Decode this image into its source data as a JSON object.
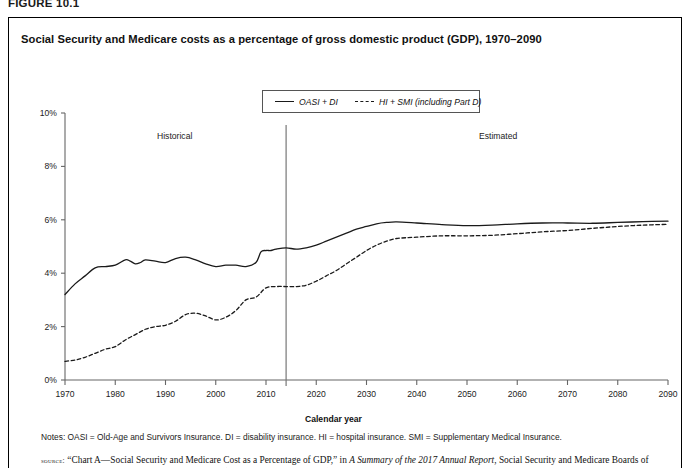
{
  "figure": {
    "number": "FIGURE 10.1",
    "title": "Social Security and Medicare costs as a percentage of gross domestic product (GDP), 1970–2090"
  },
  "notes": {
    "text": "Notes: OASI = Old-Age and Survivors Insurance. DI = disability insurance. HI = hospital insurance. SMI = Supplementary Medical Insurance."
  },
  "source": {
    "label": "source:",
    "part1": "“Chart A—Social Security and Medicare Cost as a Percentage of GDP,” in",
    "italic": "A Summary of the 2017 Annual Report",
    "part2": ", Social Security and Medicare Boards of Trustees, 2017, https://www.ssa.gov/oact/trsum/ (accessed October 30, 2017)"
  },
  "annotations": {
    "historical": "Historical",
    "estimated": "Estimated",
    "divider_year": 2014
  },
  "chart_data": {
    "type": "line",
    "title": "Social Security and Medicare costs as a percentage of gross domestic product (GDP), 1970–2090",
    "xlabel": "Calendar year",
    "ylabel": "",
    "xlim": [
      1970,
      2090
    ],
    "ylim": [
      0,
      10
    ],
    "xticks": [
      1970,
      1980,
      1990,
      2000,
      2010,
      2020,
      2030,
      2040,
      2050,
      2060,
      2070,
      2080,
      2090
    ],
    "xtick_labels": [
      "1970",
      "1980",
      "1990",
      "2000",
      "2010",
      "2020",
      "2030",
      "2040",
      "2050",
      "2060",
      "2070",
      "2080",
      "2090"
    ],
    "yticks": [
      0,
      2,
      4,
      6,
      8,
      10
    ],
    "ytick_labels": [
      "0%",
      "2%",
      "4%",
      "6%",
      "8%",
      "10%"
    ],
    "grid": false,
    "legend_position": "top-center",
    "series": [
      {
        "name": "OASI + DI",
        "style": "solid",
        "color": "#1a1a1a",
        "x": [
          1970,
          1972,
          1974,
          1976,
          1978,
          1980,
          1982,
          1983,
          1984,
          1985,
          1986,
          1988,
          1990,
          1992,
          1994,
          1996,
          1998,
          2000,
          2002,
          2004,
          2006,
          2008,
          2009,
          2010,
          2011,
          2012,
          2014,
          2016,
          2018,
          2020,
          2022,
          2024,
          2026,
          2028,
          2030,
          2032,
          2034,
          2036,
          2040,
          2045,
          2050,
          2055,
          2060,
          2065,
          2070,
          2075,
          2080,
          2085,
          2090
        ],
        "y": [
          3.2,
          3.6,
          3.9,
          4.2,
          4.25,
          4.3,
          4.5,
          4.45,
          4.35,
          4.4,
          4.5,
          4.45,
          4.4,
          4.55,
          4.6,
          4.5,
          4.35,
          4.25,
          4.3,
          4.3,
          4.25,
          4.4,
          4.8,
          4.85,
          4.85,
          4.9,
          4.95,
          4.9,
          4.95,
          5.05,
          5.2,
          5.35,
          5.5,
          5.65,
          5.75,
          5.85,
          5.9,
          5.92,
          5.88,
          5.82,
          5.78,
          5.8,
          5.85,
          5.88,
          5.88,
          5.87,
          5.9,
          5.93,
          5.95
        ]
      },
      {
        "name": "HI + SMI (including Part D)",
        "style": "dashed",
        "color": "#1a1a1a",
        "x": [
          1970,
          1972,
          1974,
          1976,
          1978,
          1980,
          1982,
          1984,
          1986,
          1988,
          1990,
          1992,
          1994,
          1996,
          1998,
          2000,
          2002,
          2004,
          2006,
          2008,
          2010,
          2012,
          2014,
          2016,
          2018,
          2020,
          2022,
          2024,
          2026,
          2028,
          2030,
          2032,
          2034,
          2036,
          2040,
          2045,
          2050,
          2055,
          2060,
          2065,
          2070,
          2075,
          2080,
          2085,
          2090
        ],
        "y": [
          0.7,
          0.75,
          0.85,
          1.0,
          1.15,
          1.25,
          1.5,
          1.7,
          1.9,
          2.0,
          2.05,
          2.2,
          2.45,
          2.5,
          2.4,
          2.25,
          2.35,
          2.6,
          3.0,
          3.1,
          3.45,
          3.5,
          3.5,
          3.5,
          3.55,
          3.7,
          3.9,
          4.1,
          4.35,
          4.6,
          4.85,
          5.05,
          5.2,
          5.3,
          5.35,
          5.4,
          5.4,
          5.42,
          5.48,
          5.55,
          5.6,
          5.68,
          5.75,
          5.8,
          5.83
        ]
      }
    ]
  }
}
